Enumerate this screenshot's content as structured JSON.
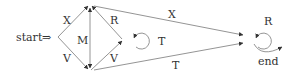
{
  "diagram": {
    "start_label": "start",
    "start_arrow": "⇒",
    "end_label": "end",
    "edges": [
      {
        "id": "start-top",
        "label": "X"
      },
      {
        "id": "start-bottom",
        "label": "V"
      },
      {
        "id": "top-bottom",
        "label": "M"
      },
      {
        "id": "top-mid",
        "label": "R"
      },
      {
        "id": "bottom-mid",
        "label": "V"
      },
      {
        "id": "mid-self",
        "label": "T"
      },
      {
        "id": "top-end",
        "label": "X"
      },
      {
        "id": "bottom-end",
        "label": "T"
      },
      {
        "id": "end-self",
        "label": "R"
      }
    ],
    "colors": {
      "line": "#888888",
      "text": "#333333"
    }
  }
}
